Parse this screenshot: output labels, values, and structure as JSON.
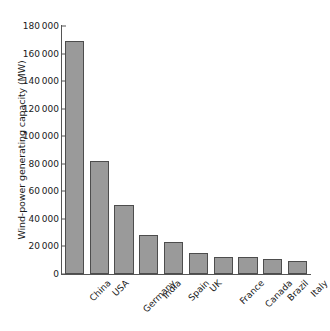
{
  "chart_data": {
    "type": "bar",
    "title": "",
    "xlabel": "",
    "ylabel": "Wind-power generating capacity (MW)",
    "ylim": [
      0,
      180000
    ],
    "ytick_step": 20000,
    "grid": false,
    "legend": null,
    "bar_color": "#9a9a9a",
    "bar_edge_color": "#4d4d4d",
    "axis_color": "#555555",
    "background_color": "#ffffff",
    "categories": [
      "China",
      "USA",
      "Germany",
      "India",
      "Spain",
      "UK",
      "France",
      "Canada",
      "Brazil",
      "Italy"
    ],
    "values": [
      169000,
      82000,
      50000,
      28500,
      23000,
      15000,
      12500,
      12200,
      11000,
      9500
    ],
    "ytick_labels": [
      "0",
      "20000",
      "40000",
      "60000",
      "80000",
      "100000",
      "120000",
      "140000",
      "160000",
      "180000"
    ],
    "ytick_values": [
      0,
      20000,
      40000,
      60000,
      80000,
      100000,
      120000,
      140000,
      160000,
      180000
    ]
  }
}
